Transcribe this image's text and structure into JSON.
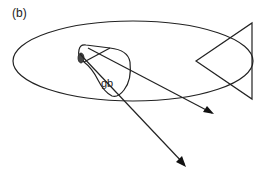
{
  "figure": {
    "panel_label": "(b)",
    "region_label": "gb",
    "stroke_color": "#222222",
    "background_color": "#ffffff"
  }
}
